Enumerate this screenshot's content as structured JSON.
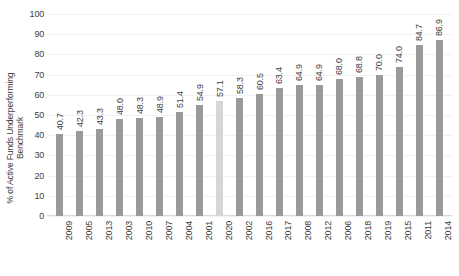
{
  "chart_data": {
    "type": "bar",
    "title": "",
    "xlabel": "",
    "ylabel": "% of Active Funds Underperforming\nBenchmark",
    "ylim": [
      0,
      100
    ],
    "ytick_labels": [
      "100",
      "90",
      "80",
      "70",
      "60",
      "50",
      "40",
      "30",
      "20",
      "10",
      "0"
    ],
    "ytick_values": [
      100,
      90,
      80,
      70,
      60,
      50,
      40,
      30,
      20,
      10,
      0
    ],
    "grid": true,
    "legend": "none",
    "categories": [
      "2009",
      "2005",
      "2013",
      "2003",
      "2010",
      "2007",
      "2004",
      "2001",
      "2020",
      "2002",
      "2016",
      "2017",
      "2008",
      "2012",
      "2006",
      "2018",
      "2019",
      "2015",
      "2011",
      "2014"
    ],
    "values": [
      40.7,
      42.3,
      43.3,
      48.0,
      48.3,
      48.9,
      51.4,
      54.9,
      57.1,
      58.3,
      60.5,
      63.4,
      64.9,
      64.9,
      68.0,
      68.8,
      70.0,
      74.0,
      84.7,
      86.9
    ],
    "data_labels": [
      "40.7",
      "42.3",
      "43.3",
      "48.0",
      "48.3",
      "48.9",
      "51.4",
      "54.9",
      "57.1",
      "58.3",
      "60.5",
      "63.4",
      "64.9",
      "64.9",
      "68.0",
      "68.8",
      "70.0",
      "74.0",
      "84.7",
      "86.9"
    ],
    "highlight_category": "2020",
    "colors": {
      "bar": "#9a9a9a",
      "bar_highlight": "#d6d6d6",
      "gridline": "#f2f2f2",
      "axis": "#d9d9d9",
      "text": "#3d3d3d",
      "background": "#ffffff"
    }
  }
}
